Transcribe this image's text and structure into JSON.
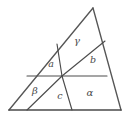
{
  "figure": {
    "name": "subdivided-triangle",
    "stroke_color": "#4c4c4c",
    "background_color": "#ffffff",
    "outline": {
      "apex": [
        93,
        8
      ],
      "bottom_left": [
        9,
        110
      ],
      "bottom_right": [
        121,
        110
      ]
    },
    "center_point": [
      62,
      76
    ],
    "lines": [
      {
        "name": "outline-left-side",
        "from": [
          9,
          110
        ],
        "to": [
          93,
          8
        ]
      },
      {
        "name": "outline-right-side",
        "from": [
          93,
          8
        ],
        "to": [
          121,
          110
        ]
      },
      {
        "name": "outline-base",
        "from": [
          9,
          110
        ],
        "to": [
          121,
          110
        ]
      },
      {
        "name": "horizontal-midline",
        "from": [
          27,
          76
        ],
        "to": [
          107,
          76
        ]
      },
      {
        "name": "cevian-upper-left",
        "from": [
          57,
          44
        ],
        "to": [
          62,
          76
        ]
      },
      {
        "name": "cevian-lower-right",
        "from": [
          62,
          76
        ],
        "to": [
          72,
          110
        ]
      },
      {
        "name": "cevian-from-base-left",
        "from": [
          27,
          110
        ],
        "to": [
          62,
          76
        ]
      },
      {
        "name": "cevian-to-right-side",
        "from": [
          62,
          76
        ],
        "to": [
          105,
          41
        ]
      }
    ],
    "labels": [
      {
        "name": "region-label-a-italic",
        "text": "a",
        "x": 51,
        "y": 64,
        "style": "italic-latin"
      },
      {
        "name": "region-label-gamma",
        "text": "γ",
        "x": 77,
        "y": 41,
        "style": "greek"
      },
      {
        "name": "region-label-b",
        "text": "b",
        "x": 93,
        "y": 60,
        "style": "italic-latin"
      },
      {
        "name": "region-label-beta",
        "text": "β",
        "x": 35,
        "y": 91,
        "style": "greek"
      },
      {
        "name": "region-label-c",
        "text": "c",
        "x": 60,
        "y": 96,
        "style": "italic-latin"
      },
      {
        "name": "region-label-alpha",
        "text": "α",
        "x": 90,
        "y": 93,
        "style": "greek"
      }
    ]
  }
}
